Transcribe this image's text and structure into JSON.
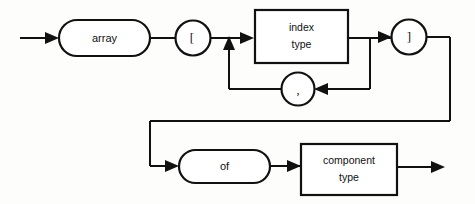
{
  "diagram": {
    "kind": "railroad-syntax-diagram",
    "background_color": "#fdfdfb",
    "line_color": "#111111",
    "node_fill": "#ffffff",
    "nodes": [
      {
        "id": "array",
        "label": "array",
        "shape": "stadium",
        "role": "terminal"
      },
      {
        "id": "lbracket",
        "label": "[",
        "shape": "circle",
        "role": "terminal"
      },
      {
        "id": "index_type",
        "label_line1": "index",
        "label_line2": "type",
        "shape": "rectangle",
        "role": "nonterminal"
      },
      {
        "id": "comma",
        "label": ",",
        "shape": "circle",
        "role": "terminal"
      },
      {
        "id": "rbracket",
        "label": "]",
        "shape": "circle",
        "role": "terminal"
      },
      {
        "id": "of",
        "label": "of",
        "shape": "stadium",
        "role": "terminal"
      },
      {
        "id": "component_type",
        "label_line1": "component",
        "label_line2": "type",
        "shape": "rectangle",
        "role": "nonterminal"
      }
    ],
    "entry_label": "entry-arrow",
    "exit_label": "exit-arrow",
    "loops": [
      {
        "id": "index-list-loop",
        "via": "comma",
        "direction": "backward"
      }
    ]
  }
}
